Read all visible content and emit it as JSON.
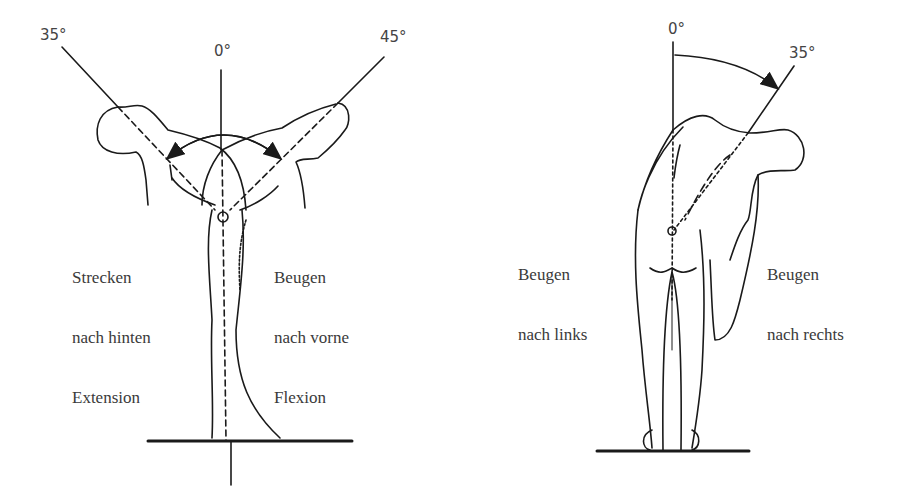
{
  "left_figure": {
    "angles": {
      "zero": "0°",
      "extension": "35°",
      "flexion": "45°"
    },
    "label_back": [
      "Strecken",
      "nach hinten",
      "Extension"
    ],
    "label_front": [
      "Beugen",
      "nach vorne",
      "Flexion"
    ]
  },
  "right_figure": {
    "angles": {
      "zero": "0°",
      "lateral": "35°"
    },
    "label_left": [
      "Beugen",
      "nach links"
    ],
    "label_right": [
      "Beugen",
      "nach rechts"
    ]
  },
  "colors": {
    "line": "#1a1a1a",
    "text": "#3a3a3a",
    "background": "#ffffff"
  }
}
